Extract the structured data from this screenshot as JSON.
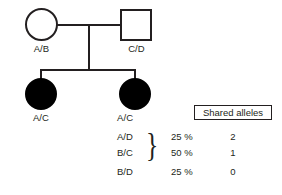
{
  "pedigree": {
    "generation1": [
      {
        "symbol": "circle",
        "sex": "female",
        "affected": false,
        "genotype": "A/B"
      },
      {
        "symbol": "square",
        "sex": "male",
        "affected": false,
        "genotype": "C/D"
      }
    ],
    "generation2": [
      {
        "symbol": "circle",
        "sex": "female",
        "affected": true,
        "genotype": "A/C"
      },
      {
        "symbol": "circle",
        "sex": "female",
        "affected": true,
        "genotype": "A/C"
      }
    ]
  },
  "table": {
    "header": "Shared alleles",
    "rows": [
      {
        "genotypes": [
          "A/C"
        ],
        "percent": "25 %",
        "shared": "2",
        "braced": false
      },
      {
        "genotypes": [
          "A/D",
          "B/C"
        ],
        "percent": "50 %",
        "shared": "1",
        "braced": true
      },
      {
        "genotypes": [
          "B/D"
        ],
        "percent": "25 %",
        "shared": "0",
        "braced": false
      }
    ],
    "brace_glyph": "}"
  },
  "colors": {
    "ink": "#231f20",
    "affected_fill": "#000000",
    "background": "#ffffff"
  }
}
